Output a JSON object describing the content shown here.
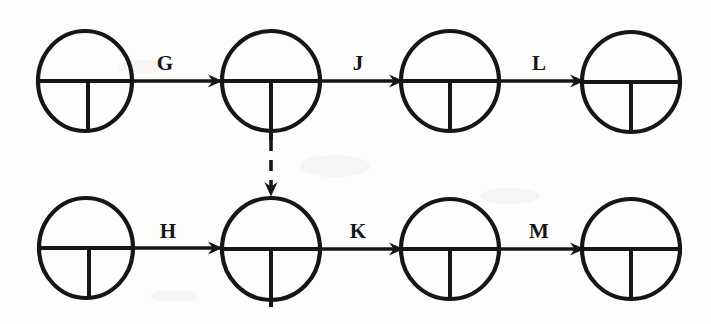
{
  "diagram": {
    "type": "activity-on-arrow-network",
    "title": "",
    "background_color": "#fdfdfc",
    "stroke_color": "#161616",
    "nodes": [
      {
        "id": "n1",
        "name": "event-node-1",
        "row": "top",
        "cx": 85,
        "cy": 81,
        "rx": 47,
        "ry": 50,
        "label": ""
      },
      {
        "id": "n2",
        "name": "event-node-2",
        "row": "top",
        "cx": 271,
        "cy": 81,
        "rx": 49,
        "ry": 50,
        "label": ""
      },
      {
        "id": "n3",
        "name": "event-node-3",
        "row": "top",
        "cx": 450,
        "cy": 81,
        "rx": 49,
        "ry": 50,
        "label": ""
      },
      {
        "id": "n4",
        "name": "event-node-4",
        "row": "top",
        "cx": 631,
        "cy": 82,
        "rx": 49,
        "ry": 50,
        "label": ""
      },
      {
        "id": "n5",
        "name": "event-node-5",
        "row": "bottom",
        "cx": 86,
        "cy": 248,
        "rx": 47,
        "ry": 50,
        "label": ""
      },
      {
        "id": "n6",
        "name": "event-node-6",
        "row": "bottom",
        "cx": 271,
        "cy": 249,
        "rx": 49,
        "ry": 51,
        "label": ""
      },
      {
        "id": "n7",
        "name": "event-node-7",
        "row": "bottom",
        "cx": 450,
        "cy": 249,
        "rx": 49,
        "ry": 50,
        "label": ""
      },
      {
        "id": "n8",
        "name": "event-node-8",
        "row": "bottom",
        "cx": 631,
        "cy": 249,
        "rx": 49,
        "ry": 50,
        "label": ""
      }
    ],
    "edges": [
      {
        "id": "e_G",
        "label": "G",
        "from": "n1",
        "to": "n2",
        "style": "solid",
        "direction": "right",
        "label_x": 165,
        "label_y": 70
      },
      {
        "id": "e_J",
        "label": "J",
        "from": "n2",
        "to": "n3",
        "style": "solid",
        "direction": "right",
        "label_x": 358,
        "label_y": 70
      },
      {
        "id": "e_L",
        "label": "L",
        "from": "n3",
        "to": "n4",
        "style": "solid",
        "direction": "right",
        "label_x": 539,
        "label_y": 70
      },
      {
        "id": "e_D",
        "label": "",
        "from": "n2",
        "to": "n6",
        "style": "dashed",
        "direction": "down",
        "label_x": 0,
        "label_y": 0
      },
      {
        "id": "e_H",
        "label": "H",
        "from": "n5",
        "to": "n6",
        "style": "solid",
        "direction": "right",
        "label_x": 168,
        "label_y": 238
      },
      {
        "id": "e_K",
        "label": "K",
        "from": "n6",
        "to": "n7",
        "style": "solid",
        "direction": "right",
        "label_x": 358,
        "label_y": 238
      },
      {
        "id": "e_M",
        "label": "M",
        "from": "n7",
        "to": "n8",
        "style": "solid",
        "direction": "right",
        "label_x": 539,
        "label_y": 238
      }
    ],
    "labels": {
      "G": "G",
      "J": "J",
      "L": "L",
      "H": "H",
      "K": "K",
      "M": "M"
    }
  }
}
